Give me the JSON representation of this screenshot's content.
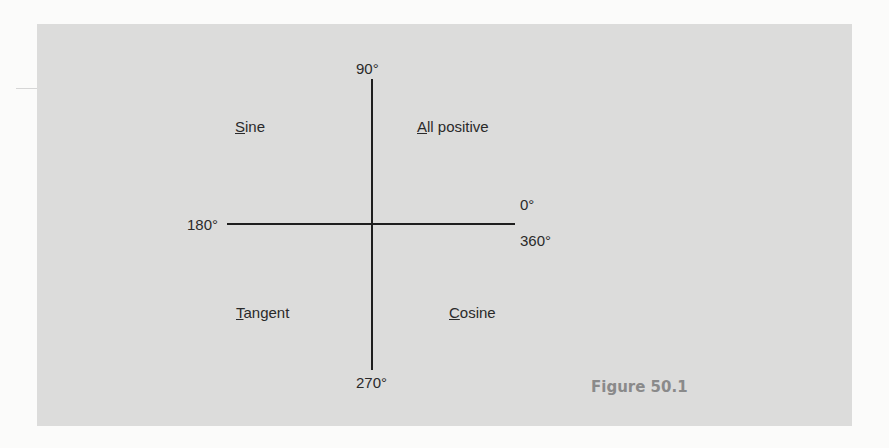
{
  "diagram": {
    "angles": {
      "top": "90°",
      "left": "180°",
      "right_upper": "0°",
      "right_lower": "360°",
      "bottom": "270°"
    },
    "quadrants": {
      "first": {
        "initial": "A",
        "rest": "ll positive"
      },
      "second": {
        "initial": "S",
        "rest": "ine"
      },
      "third": {
        "initial": "T",
        "rest": "angent"
      },
      "fourth": {
        "initial": "C",
        "rest": "osine"
      }
    },
    "caption": "Figure 50.1"
  },
  "colors": {
    "panel": "#dcdcdb",
    "axis": "#1e1e1e",
    "caption": "#8a8a8a"
  }
}
